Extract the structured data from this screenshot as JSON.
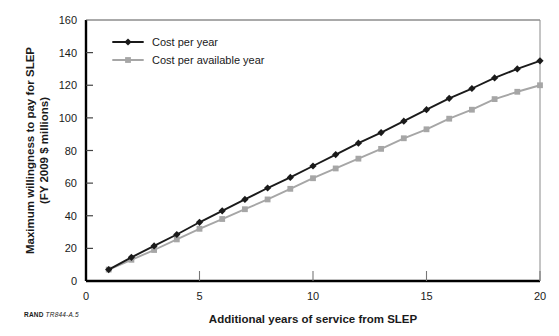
{
  "figure": {
    "source_note_prefix": "RAND",
    "source_note_code": "TR844-A.5"
  },
  "chart_data": {
    "type": "line",
    "title": "",
    "xlabel": "Additional years of service from SLEP",
    "ylabel": "Maximum willingness to pay for SLEP\n(FY 2009 $ millions)",
    "ylabel_line1": "Maximum willingness to pay for SLEP",
    "ylabel_line2": "(FY 2009 $ millions)",
    "xlim": [
      0,
      20
    ],
    "ylim": [
      0,
      160
    ],
    "xticks": [
      0,
      5,
      10,
      15,
      20
    ],
    "xtick_labels": [
      "0",
      "5",
      "10",
      "15",
      "20"
    ],
    "yticks": [
      0,
      20,
      40,
      60,
      80,
      100,
      120,
      140,
      160
    ],
    "ytick_labels": [
      "0",
      "20",
      "40",
      "60",
      "80",
      "100",
      "120",
      "140",
      "160"
    ],
    "grid": false,
    "legend_position": "top-left",
    "x": [
      1,
      2,
      3,
      4,
      5,
      6,
      7,
      8,
      9,
      10,
      11,
      12,
      13,
      14,
      15,
      16,
      17,
      18,
      19,
      20
    ],
    "series": [
      {
        "name": "Cost per year",
        "color": "#1a1a1a",
        "marker": "diamond",
        "values": [
          7,
          14.5,
          21.5,
          28.5,
          36,
          43,
          50,
          57,
          63.5,
          70.5,
          77.5,
          84.5,
          91,
          98,
          105,
          112,
          118,
          124.5,
          130,
          135
        ]
      },
      {
        "name": "Cost per available year",
        "color": "#a6a6a6",
        "marker": "square",
        "values": [
          7,
          13,
          19,
          25.5,
          32,
          38,
          44,
          50,
          56.5,
          63,
          69,
          75,
          81,
          87.5,
          93,
          99.5,
          105,
          111.5,
          116,
          120
        ]
      }
    ]
  }
}
